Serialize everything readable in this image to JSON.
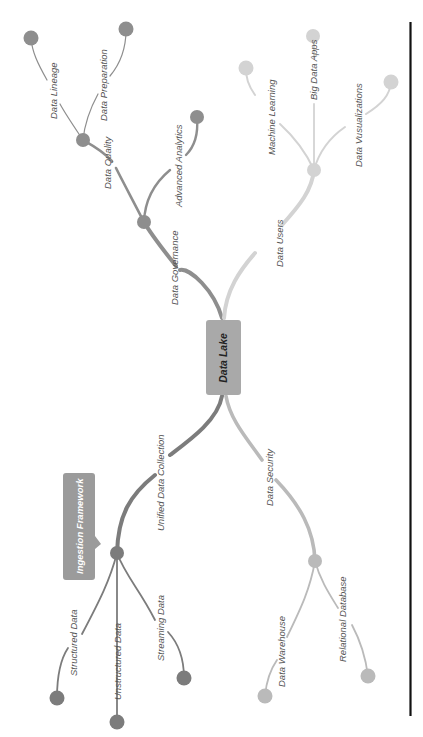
{
  "diagram": {
    "type": "mind-map",
    "orientation": "rotated-90-counterclockwise",
    "center": {
      "label": "Data Lake",
      "color": "#a9a9a9"
    },
    "callout": {
      "label": "Ingestion Framework",
      "color": "#9b9b9b",
      "attached_to": "Unified Data Collection"
    },
    "branches": [
      {
        "label": "Data Governance",
        "color": "#8e8e8e",
        "children": [
          {
            "label": "Data Quality",
            "children": [
              {
                "label": "Data Lineage"
              },
              {
                "label": "Data Preparation"
              }
            ]
          },
          {
            "label": "Advanced Analytics"
          }
        ]
      },
      {
        "label": "Data Users",
        "color": "#d3d3d3",
        "children": [
          {
            "label": "Machine Learning"
          },
          {
            "label": "Big Data Apps"
          },
          {
            "label": "Data Vusualizations"
          }
        ]
      },
      {
        "label": "Unified Data Collection",
        "color": "#7c7c7c",
        "children": [
          {
            "label": "Structured Data"
          },
          {
            "label": "Unstructured Data"
          },
          {
            "label": "Streaming Data"
          }
        ]
      },
      {
        "label": "Data Security",
        "color": "#bababa",
        "children": [
          {
            "label": "Data Warehouse"
          },
          {
            "label": "Relational Database"
          }
        ]
      }
    ]
  },
  "frame": {
    "rule_color": "#111111"
  }
}
